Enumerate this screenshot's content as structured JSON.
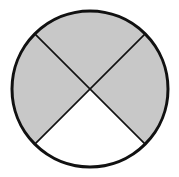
{
  "diagram": {
    "type": "fraction-circle",
    "total_parts": 4,
    "shaded_parts": 3,
    "shaded_sectors": [
      "top",
      "left",
      "right"
    ],
    "unshaded_sectors": [
      "bottom"
    ],
    "colors": {
      "shade": "#c8c8c8",
      "unshaded": "#ffffff",
      "stroke": "#111111"
    }
  }
}
